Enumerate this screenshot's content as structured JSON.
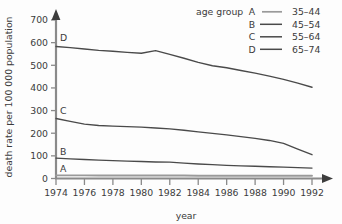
{
  "chart_data": {
    "type": "line",
    "title": "",
    "xlabel": "year",
    "ylabel": "death rate per 100 000 population",
    "xlim": [
      1974,
      1992
    ],
    "ylim": [
      0,
      700
    ],
    "grid": false,
    "legend_position": "top-right",
    "legend_title": "age group",
    "x": [
      1974,
      1975,
      1976,
      1977,
      1978,
      1979,
      1980,
      1981,
      1982,
      1983,
      1984,
      1985,
      1986,
      1987,
      1988,
      1989,
      1990,
      1991,
      1992
    ],
    "xticks": [
      "1974",
      "1976",
      "1978",
      "1980",
      "1982",
      "1984",
      "1986",
      "1988",
      "1990",
      "1992"
    ],
    "xtick_values": [
      1974,
      1976,
      1978,
      1980,
      1982,
      1984,
      1986,
      1988,
      1990,
      1992
    ],
    "yticks": [
      "0",
      "100",
      "200",
      "300",
      "400",
      "500",
      "600",
      "700"
    ],
    "ytick_values": [
      0,
      100,
      200,
      300,
      400,
      500,
      600,
      700
    ],
    "series": [
      {
        "key": "A",
        "name": "35-44",
        "label": "A",
        "color": "#9a9a9a",
        "values": [
          14,
          14,
          14,
          13,
          13,
          13,
          13,
          13,
          13,
          13,
          12,
          12,
          12,
          12,
          12,
          12,
          12,
          12,
          12
        ]
      },
      {
        "key": "B",
        "name": "45-54",
        "label": "B",
        "color": "#4a4a4a",
        "values": [
          90,
          87,
          84,
          81,
          79,
          77,
          75,
          73,
          72,
          68,
          64,
          61,
          58,
          56,
          54,
          52,
          50,
          48,
          46
        ]
      },
      {
        "key": "C",
        "name": "55-64",
        "label": "C",
        "color": "#4a4a4a",
        "values": [
          265,
          252,
          240,
          234,
          231,
          229,
          227,
          223,
          219,
          213,
          206,
          199,
          193,
          185,
          177,
          168,
          155,
          130,
          105
        ]
      },
      {
        "key": "D",
        "name": "65-74",
        "label": "D",
        "color": "#4a4a4a",
        "values": [
          583,
          578,
          572,
          566,
          562,
          557,
          553,
          565,
          548,
          531,
          513,
          498,
          489,
          477,
          465,
          452,
          438,
          421,
          403
        ]
      }
    ],
    "legend_entries": [
      {
        "label": "A",
        "range": "35–44"
      },
      {
        "label": "B",
        "range": "45–54"
      },
      {
        "label": "C",
        "range": "55–64"
      },
      {
        "label": "D",
        "range": "65–74"
      }
    ],
    "curve_labels": [
      {
        "label": "D",
        "at_year": 1974,
        "at_value": 620
      },
      {
        "label": "C",
        "at_year": 1974,
        "at_value": 300
      },
      {
        "label": "B",
        "at_year": 1974,
        "at_value": 118
      },
      {
        "label": "A",
        "at_year": 1974,
        "at_value": 45
      }
    ]
  },
  "legend": {
    "title": "age group"
  },
  "axes": {
    "x_title": "year",
    "y_title": "death rate per 100 000 population"
  }
}
